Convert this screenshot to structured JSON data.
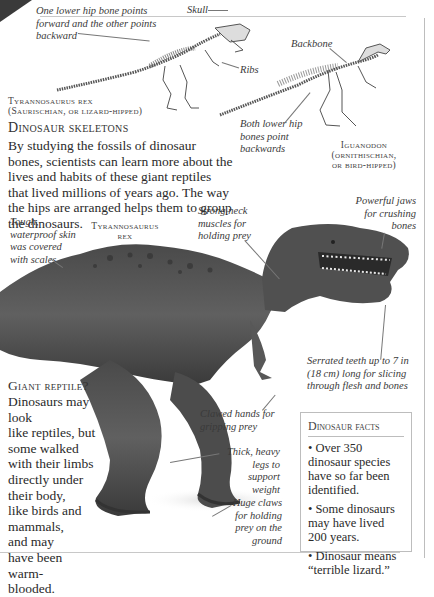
{
  "skeletons": {
    "trex": {
      "annotations": {
        "hip": "One lower hip bone points forward and the other points backward",
        "skull": "Skull",
        "ribs": "Ribs"
      },
      "name_line1": "Tyrannosaurus rex",
      "name_line2": "(Saurischian, or lizard-hipped)"
    },
    "iguanodon": {
      "annotations": {
        "backbone": "Backbone",
        "hip": "Both lower hip bones point backwards"
      },
      "name_line1": "Iguanodon",
      "name_line2": "(ornithischian,",
      "name_line3": "or bird-hipped)"
    }
  },
  "skeletons_section": {
    "heading": "Dinosaur skeletons",
    "body": "By studying the fossils of dinosaur bones, scientists can learn more about the lives and habits of these giant reptiles that lived millions of years ago. The way the hips are arranged helps them to group the dinosaurs."
  },
  "trex_model": {
    "label_line1": "Tyrannosaurus",
    "label_line2": "rex",
    "annotations": {
      "skin": "Tough, waterproof skin was covered with scales",
      "neck": "Strong neck muscles for holding prey",
      "jaws": "Powerful jaws for crushing bones",
      "teeth": "Serrated teeth up to 7 in (18 cm) long for slicing through flesh and bones",
      "hands": "Clawed hands for gripping prey",
      "legs": "Thick, heavy legs to support weight",
      "claws": "Huge claws for holding prey on the ground"
    }
  },
  "giant_reptile": {
    "heading": "Giant reptile?",
    "lines": [
      "Dinosaurs may look",
      "like reptiles, but",
      "some walked",
      "with their limbs",
      "directly under",
      "their body,",
      "like birds and",
      "mammals,",
      "and may",
      "have been",
      "warm-",
      "blooded."
    ]
  },
  "facts": {
    "title": "Dinosaur facts",
    "items": [
      "Over 350 dinosaur species have so far been identified.",
      "Some dinosaurs may have lived 200 years.",
      "Dinosaur means “terrible lizard.”"
    ],
    "bullet": "•"
  },
  "colors": {
    "skin_dark": "#3d3d3d",
    "skin_mid": "#5a5a5a",
    "rule": "#c8c8c8"
  }
}
